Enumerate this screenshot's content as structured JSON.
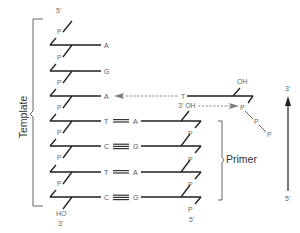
{
  "labels": {
    "template": "Template",
    "primer": "Primer",
    "five_prime": "5'",
    "three_prime": "3'",
    "oh": "OH",
    "ho": "HO",
    "phosphate": "P",
    "three_prime_oh": "3' OH"
  },
  "template_strand": {
    "end_top": "5'",
    "end_bottom_group": "HO",
    "end_bottom": "3'",
    "bases": [
      "A",
      "G",
      "A",
      "T",
      "C",
      "T",
      "C"
    ]
  },
  "primer_strand": {
    "bases": [
      "A",
      "G",
      "A",
      "G"
    ],
    "end_bottom": "5'",
    "free_3_oh": "3' OH"
  },
  "incoming_nucleotide": {
    "base": "T",
    "sugar_group": "OH",
    "phosphates": [
      "P",
      "P",
      "P"
    ]
  },
  "direction_arrow": {
    "top": "3'",
    "bottom": "5'"
  },
  "colors": {
    "strand": "#1e1e1e",
    "label": "#6a6a6a",
    "dashed_arrow": "#7a7a7a"
  }
}
